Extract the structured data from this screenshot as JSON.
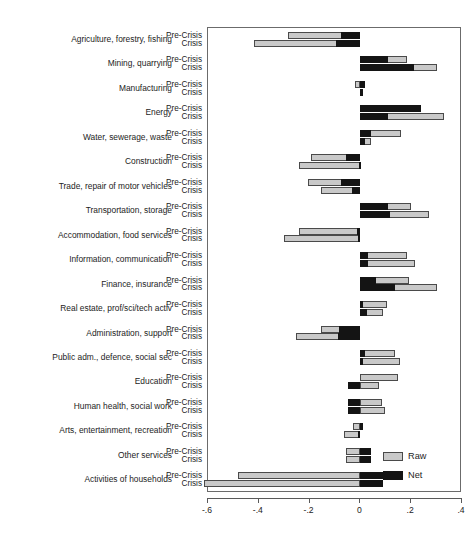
{
  "chart_data": {
    "type": "bar",
    "title": "",
    "subtitle": "",
    "xlabel": "",
    "ylabel": "",
    "orientation": "horizontal",
    "stacked": true,
    "xlim": [
      -0.6,
      0.4
    ],
    "xticks": [
      -0.6,
      -0.4,
      -0.2,
      0,
      0.2,
      0.4
    ],
    "xticklabels": [
      "-.6",
      "-.4",
      "-.2",
      "0",
      ".2",
      ".4"
    ],
    "grid": false,
    "legend": {
      "position": "bottom-right",
      "entries": [
        {
          "label": "Raw",
          "color": "#c9c9c9"
        },
        {
          "label": "Net",
          "color": "#141414"
        }
      ]
    },
    "series": [
      {
        "name": "Raw",
        "color": "#c9c9c9"
      },
      {
        "name": "Net",
        "color": "#141414"
      }
    ],
    "row_labels": [
      "Pre-Crisis",
      "Crisis"
    ],
    "categories": [
      "Agriculture, forestry, fishing",
      "Mining, quarrying",
      "Manufacturing",
      "Energy",
      "Water, sewerage, waste",
      "Construction",
      "Trade, repair of motor vehicles",
      "Transportation, storage",
      "Accommodation, food services",
      "Information, communication",
      "Finance, insurance",
      "Real estate, prof/sci/tech activ",
      "Administration, support",
      "Public adm., defence, social sec",
      "Education",
      "Human health, social work",
      "Arts, entertainment, recreation",
      "Other services",
      "Activities of households"
    ],
    "bars": [
      {
        "category": "Agriculture, forestry, fishing",
        "row": "Pre-Crisis",
        "net": -0.075,
        "raw": -0.285
      },
      {
        "category": "Agriculture, forestry, fishing",
        "row": "Crisis",
        "net": -0.095,
        "raw": -0.42
      },
      {
        "category": "Mining, quarrying",
        "row": "Pre-Crisis",
        "net": 0.11,
        "raw": 0.185
      },
      {
        "category": "Mining, quarrying",
        "row": "Crisis",
        "net": 0.21,
        "raw": 0.3
      },
      {
        "category": "Manufacturing",
        "row": "Pre-Crisis",
        "net": 0.02,
        "raw": -0.02
      },
      {
        "category": "Manufacturing",
        "row": "Crisis",
        "net": 0.01,
        "raw": 0.01
      },
      {
        "category": "Energy",
        "row": "Pre-Crisis",
        "net": 0.24,
        "raw": 0.24
      },
      {
        "category": "Energy",
        "row": "Crisis",
        "net": 0.11,
        "raw": 0.33
      },
      {
        "category": "Water, sewerage, waste",
        "row": "Pre-Crisis",
        "net": 0.04,
        "raw": 0.16
      },
      {
        "category": "Water, sewerage, waste",
        "row": "Crisis",
        "net": 0.02,
        "raw": 0.04
      },
      {
        "category": "Construction",
        "row": "Pre-Crisis",
        "net": -0.055,
        "raw": -0.195
      },
      {
        "category": "Construction",
        "row": "Crisis",
        "net": -0.005,
        "raw": -0.24
      },
      {
        "category": "Trade, repair of motor vehicles",
        "row": "Pre-Crisis",
        "net": -0.075,
        "raw": -0.205
      },
      {
        "category": "Trade, repair of motor vehicles",
        "row": "Crisis",
        "net": -0.035,
        "raw": -0.155
      },
      {
        "category": "Transportation, storage",
        "row": "Pre-Crisis",
        "net": 0.11,
        "raw": 0.2
      },
      {
        "category": "Transportation, storage",
        "row": "Crisis",
        "net": 0.115,
        "raw": 0.27
      },
      {
        "category": "Accommodation, food services",
        "row": "Pre-Crisis",
        "net": -0.015,
        "raw": -0.24
      },
      {
        "category": "Accommodation, food services",
        "row": "Crisis",
        "net": -0.01,
        "raw": -0.3
      },
      {
        "category": "Information, communication",
        "row": "Pre-Crisis",
        "net": 0.03,
        "raw": 0.185
      },
      {
        "category": "Information, communication",
        "row": "Crisis",
        "net": 0.03,
        "raw": 0.215
      },
      {
        "category": "Finance, insurance",
        "row": "Pre-Crisis",
        "net": 0.06,
        "raw": 0.19
      },
      {
        "category": "Finance, insurance",
        "row": "Crisis",
        "net": 0.135,
        "raw": 0.3
      },
      {
        "category": "Real estate, prof/sci/tech activ",
        "row": "Pre-Crisis",
        "net": 0.01,
        "raw": 0.105
      },
      {
        "category": "Real estate, prof/sci/tech activ",
        "row": "Crisis",
        "net": 0.025,
        "raw": 0.09
      },
      {
        "category": "Administration, support",
        "row": "Pre-Crisis",
        "net": -0.085,
        "raw": -0.155
      },
      {
        "category": "Administration, support",
        "row": "Crisis",
        "net": -0.09,
        "raw": -0.255
      },
      {
        "category": "Public adm., defence, social sec",
        "row": "Pre-Crisis",
        "net": 0.02,
        "raw": 0.135
      },
      {
        "category": "Public adm., defence, social sec",
        "row": "Crisis",
        "net": 0.01,
        "raw": 0.155
      },
      {
        "category": "Education",
        "row": "Pre-Crisis",
        "net": 0.0,
        "raw": 0.15
      },
      {
        "category": "Education",
        "row": "Crisis",
        "net": -0.05,
        "raw": 0.075
      },
      {
        "category": "Human health, social work",
        "row": "Pre-Crisis",
        "net": -0.05,
        "raw": 0.085
      },
      {
        "category": "Human health, social work",
        "row": "Crisis",
        "net": -0.05,
        "raw": 0.095
      },
      {
        "category": "Arts, entertainment, recreation",
        "row": "Pre-Crisis",
        "net": 0.01,
        "raw": -0.03
      },
      {
        "category": "Arts, entertainment, recreation",
        "row": "Crisis",
        "net": -0.01,
        "raw": -0.065
      },
      {
        "category": "Other services",
        "row": "Pre-Crisis",
        "net": 0.04,
        "raw": -0.055
      },
      {
        "category": "Other services",
        "row": "Crisis",
        "net": 0.04,
        "raw": -0.055
      },
      {
        "category": "Activities of households",
        "row": "Pre-Crisis",
        "net": 0.09,
        "raw": -0.48
      },
      {
        "category": "Activities of households",
        "row": "Crisis",
        "net": 0.09,
        "raw": -0.615
      }
    ]
  },
  "caption": ""
}
